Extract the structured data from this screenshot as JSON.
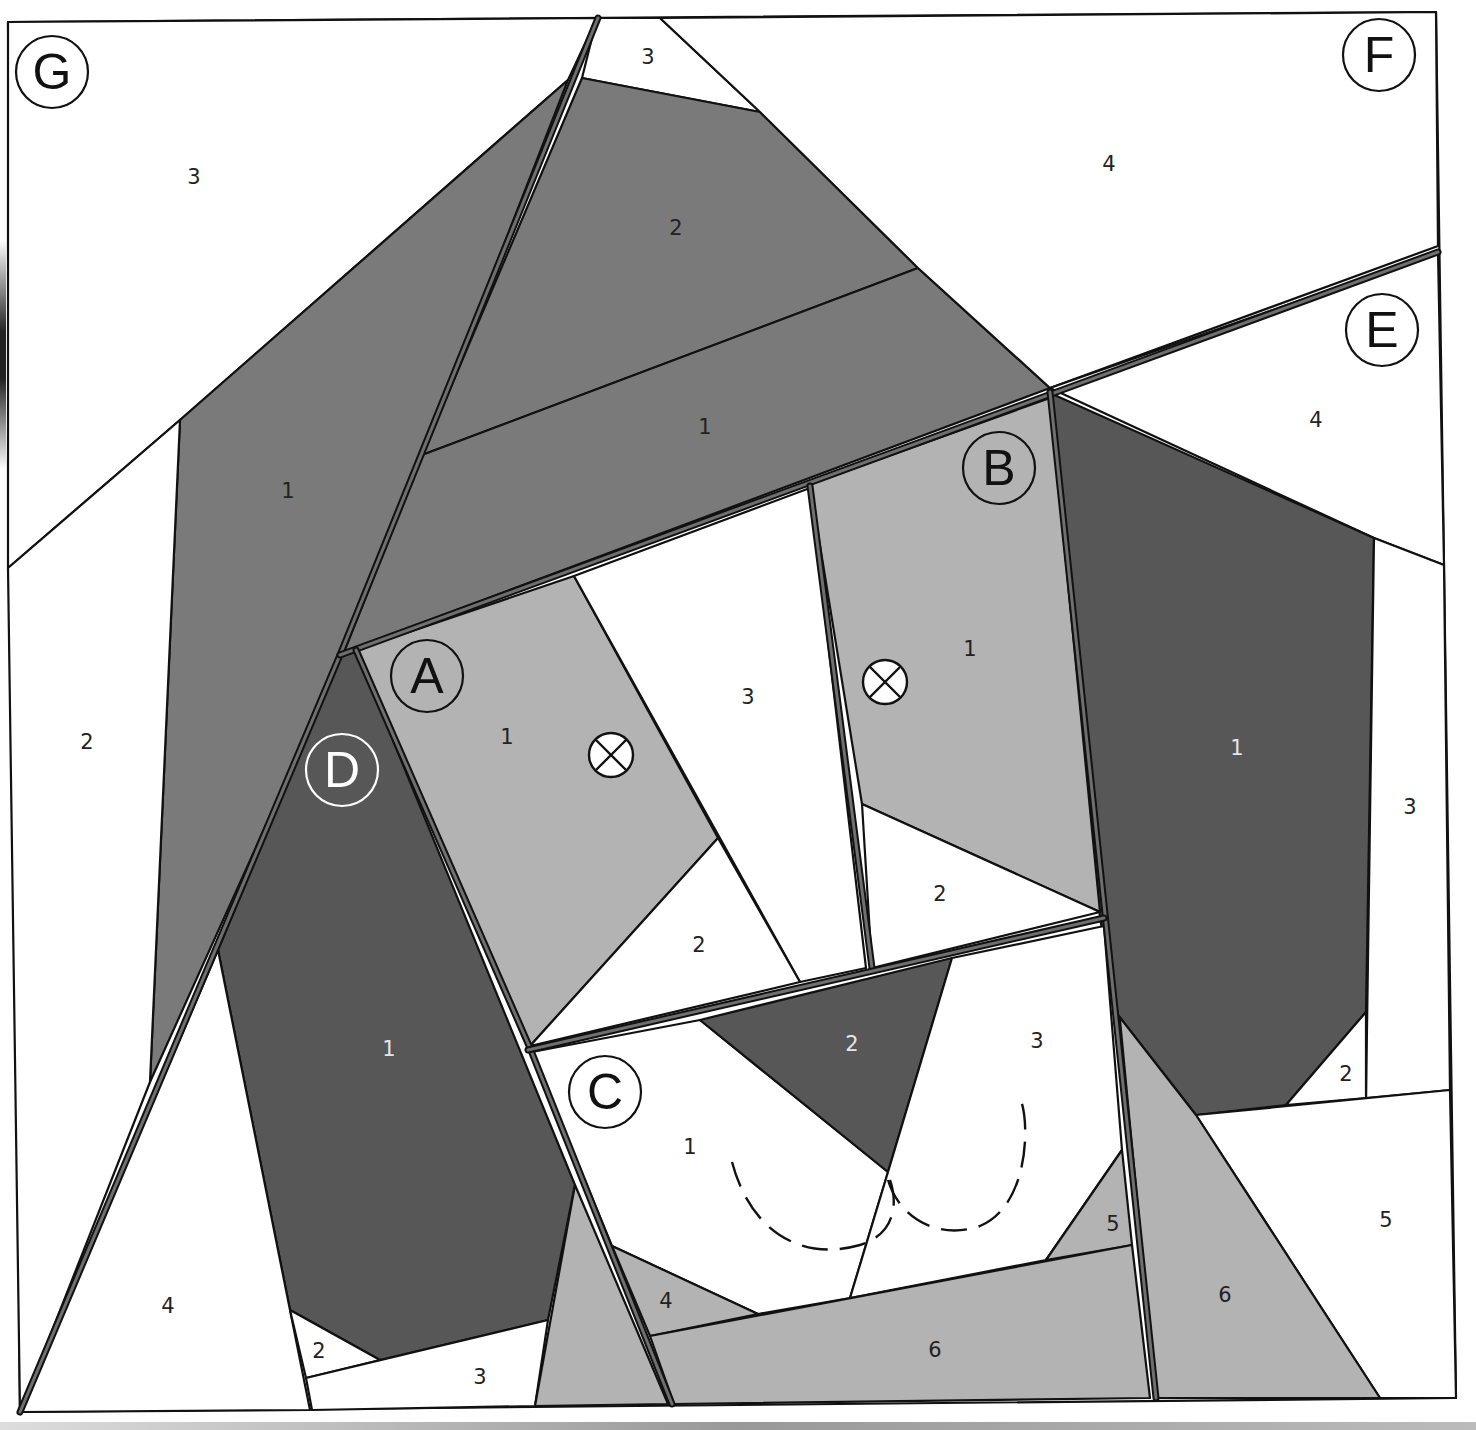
{
  "pattern": {
    "subject": "Dog face paper-piecing pattern",
    "colors": {
      "white": "#ffffff",
      "light_gray": "#b3b3b3",
      "mid_gray": "#7a7a7a",
      "dark_gray": "#575757",
      "line": "#111111"
    },
    "sections": [
      {
        "letter": "A",
        "pieces": [
          "1",
          "2",
          "3"
        ],
        "has_eye": true
      },
      {
        "letter": "B",
        "pieces": [
          "1",
          "2"
        ],
        "has_eye": true
      },
      {
        "letter": "C",
        "pieces": [
          "1",
          "2",
          "3",
          "4",
          "5",
          "6"
        ],
        "has_eye": false
      },
      {
        "letter": "D",
        "pieces": [
          "1",
          "2",
          "3",
          "4"
        ],
        "has_eye": false
      },
      {
        "letter": "E",
        "pieces": [
          "1",
          "2",
          "3",
          "4",
          "5",
          "6"
        ],
        "has_eye": false
      },
      {
        "letter": "F",
        "pieces": [
          "1",
          "2",
          "3",
          "4"
        ],
        "has_eye": false
      },
      {
        "letter": "G",
        "pieces": [
          "1",
          "2",
          "3"
        ],
        "has_eye": false
      }
    ],
    "labels": {
      "A": "A",
      "B": "B",
      "C": "C",
      "D": "D",
      "E": "E",
      "F": "F",
      "G": "G",
      "A1": "1",
      "A2": "2",
      "A3": "3",
      "B1": "1",
      "B2": "2",
      "C1": "1",
      "C2": "2",
      "C3": "3",
      "C4": "4",
      "C5": "5",
      "C6": "6",
      "D1": "1",
      "D2": "2",
      "D3": "3",
      "D4": "4",
      "E1": "1",
      "E2": "2",
      "E3": "3",
      "E4": "4",
      "E5": "5",
      "E6": "6",
      "F1": "1",
      "F2": "2",
      "F3": "3",
      "F4": "4",
      "G1": "1",
      "G2": "2",
      "G3": "3"
    },
    "markers": {
      "eye_symbol": "circled-x",
      "nose_stitch": "dashed-line"
    }
  }
}
